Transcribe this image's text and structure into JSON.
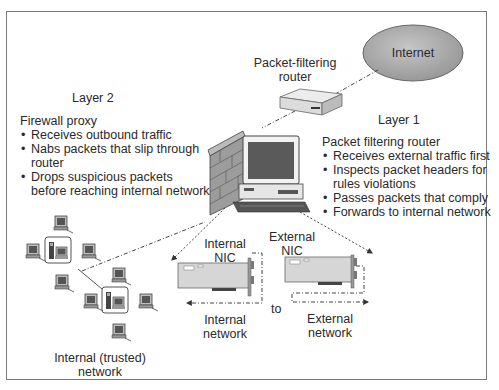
{
  "diagram": {
    "internet": {
      "label": "Internet"
    },
    "router": {
      "label_line1": "Packet-filtering",
      "label_line2": "router"
    },
    "layer1": {
      "title": "Layer 1",
      "heading": "Packet filtering router",
      "bullets": [
        "Receives external traffic first",
        "Inspects packet headers for",
        "rules violations",
        "Passes packets that comply",
        "Forwards to internal network"
      ]
    },
    "layer2": {
      "title": "Layer 2",
      "heading": "Firewall proxy",
      "bullets": [
        "Receives outbound traffic",
        "Nabs packets that slip through",
        "router",
        "Drops suspicious packets",
        "before reaching internal network"
      ]
    },
    "internal_nic": {
      "label_line1": "Internal",
      "label_line2": "NIC"
    },
    "external_nic": {
      "label_line1": "External",
      "label_line2": "NIC"
    },
    "internal_network_label": {
      "line1": "Internal",
      "line2": "network"
    },
    "external_network_label": {
      "line1": "External",
      "line2": "network"
    },
    "to_label": "to",
    "trusted_network": {
      "line1": "Internal (trusted)",
      "line2": "network"
    },
    "colors": {
      "internet_fill": "#a9a9a9",
      "frame": "#7a7a7a",
      "line": "#444444",
      "device_gray": "#c8c8c8",
      "dark": "#333333"
    }
  }
}
